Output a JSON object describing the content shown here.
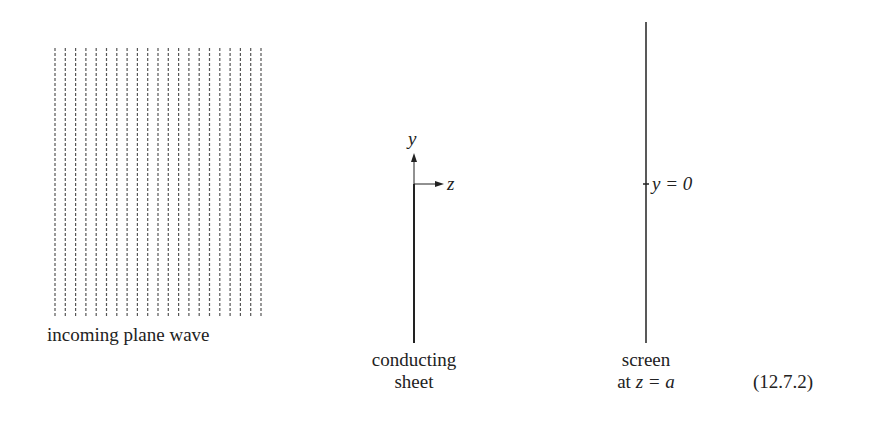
{
  "figure": {
    "equation_number": "(12.7.2)",
    "wave": {
      "label": "incoming plane wave",
      "line_count": 21,
      "x_start": 55,
      "spacing": 10.3,
      "y_top": 48,
      "y_bottom": 318
    },
    "axes": {
      "y_label": "y",
      "z_label": "z"
    },
    "sheet": {
      "label_line1": "conducting",
      "label_line2": "sheet"
    },
    "screen": {
      "label_line1": "screen",
      "label_line2_prefix": "at ",
      "label_line2_math": "z = a",
      "origin_label": "y = 0"
    },
    "colors": {
      "ink": "#222222",
      "dash": "#555555",
      "background": "#ffffff"
    }
  }
}
